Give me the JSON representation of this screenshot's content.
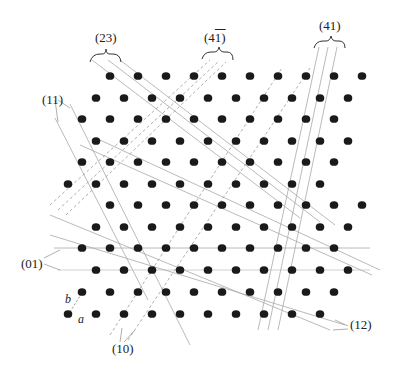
{
  "figure": {
    "basis_labels": {
      "a": "a",
      "b": "b"
    },
    "dot_color": "#1a1a1a",
    "line_color": "#9a9a9a",
    "lattice": {
      "a_vector": [
        28,
        0
      ],
      "b_vector": [
        14,
        -21.5
      ],
      "dot_radius": 4.3,
      "rows": [
        {
          "y": 76,
          "x_start": 110,
          "count": 10
        },
        {
          "y": 98,
          "x_start": 96,
          "count": 10
        },
        {
          "y": 119,
          "x_start": 82,
          "count": 10
        },
        {
          "y": 141,
          "x_start": 96,
          "count": 10
        },
        {
          "y": 162,
          "x_start": 82,
          "count": 10
        },
        {
          "y": 184,
          "x_start": 68,
          "count": 10
        },
        {
          "y": 205,
          "x_start": 110,
          "count": 10
        },
        {
          "y": 227,
          "x_start": 96,
          "count": 10
        },
        {
          "y": 248,
          "x_start": 82,
          "count": 10
        },
        {
          "y": 270,
          "x_start": 96,
          "count": 10
        },
        {
          "y": 292,
          "x_start": 82,
          "count": 10
        },
        {
          "y": 314,
          "x_start": 68,
          "count": 10
        }
      ]
    },
    "plane_families": [
      {
        "index": "(23)",
        "label_pos": [
          95,
          52
        ],
        "style": "solid"
      },
      {
        "index": "(4̅1)",
        "label_pos": [
          203,
          31
        ],
        "style": "dashed"
      },
      {
        "index": "(41)",
        "label_pos": [
          319,
          23
        ],
        "style": "solid"
      },
      {
        "index": "(11)",
        "label_pos": [
          42,
          95
        ],
        "style": "solid"
      },
      {
        "index": "(01)",
        "label_pos": [
          22,
          258
        ],
        "style": "solid"
      },
      {
        "index": "(10)",
        "label_pos": [
          113,
          347
        ],
        "style": "dashed"
      },
      {
        "index": "(12)",
        "label_pos": [
          349,
          322
        ],
        "style": "solid"
      }
    ],
    "labels": {
      "l23": "(23)",
      "l41bar_digit": "4",
      "l41bar_rest": "1)",
      "l41bar_open": "(",
      "l41": "(41)",
      "l11": "(11)",
      "l01": "(01)",
      "l10": "(10)",
      "l12": "(12)",
      "basis_a": "a",
      "basis_b": "b"
    }
  }
}
